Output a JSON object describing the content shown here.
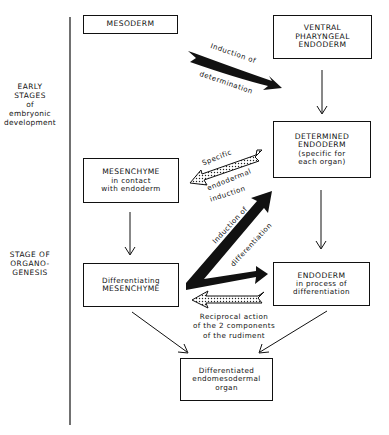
{
  "stages": {
    "early": [
      "EARLY",
      "STAGES",
      "of",
      "embryonic",
      "development"
    ],
    "organogenesis": [
      "STAGE OF",
      "ORGANO-",
      "GENESIS"
    ]
  },
  "boxes": {
    "mesoderm": {
      "title": "MESODERM"
    },
    "ventral_endoderm": {
      "lines": [
        "VENTRAL",
        "PHARYNGEAL",
        "ENDODERM"
      ]
    },
    "determined_endoderm": {
      "lines": [
        "DETERMINED",
        "ENDODERM"
      ],
      "sub": [
        "(specific for",
        "each organ)"
      ]
    },
    "mesenchyme_contact": {
      "title": "MESENCHYME",
      "sub": [
        "in contact",
        "with endoderm"
      ]
    },
    "diff_mesenchyme": {
      "sub": [
        "Differentiating"
      ],
      "title": "MESENCHYME"
    },
    "endoderm_process": {
      "title": "ENDODERM",
      "sub": [
        "in process of",
        "differentiation"
      ]
    },
    "organ": {
      "sub": [
        "Differentiated",
        "endomesodermal",
        "organ"
      ]
    }
  },
  "arrow_labels": {
    "determination_1": "Induction of",
    "determination_2": "determination",
    "specific_1": "Specific",
    "specific_2": "endodermal",
    "specific_3": "induction",
    "differentiation_1": "Induction of",
    "differentiation_2": "differentiation",
    "reciprocal": [
      "Reciprocal action",
      "of the 2 components",
      "of the rudiment"
    ]
  },
  "colors": {
    "ink": "#111111",
    "paper": "#ffffff"
  }
}
